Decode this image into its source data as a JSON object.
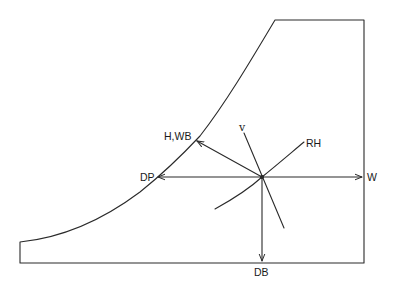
{
  "diagram": {
    "title": "",
    "labels": {
      "enthalpy_wetbulb": "H,WB",
      "dew_point": "DP",
      "specific_volume": "v",
      "relative_humidity": "RH",
      "humidity_ratio": "W",
      "dry_bulb": "DB"
    },
    "colors": {
      "line": "#2a2a2a",
      "background": "#ffffff"
    }
  }
}
